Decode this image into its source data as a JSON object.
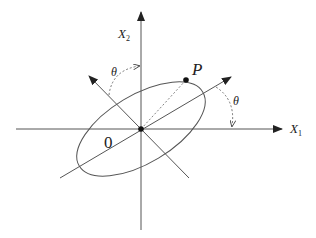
{
  "diagram": {
    "labels": {
      "x1_axis": "X",
      "x1_sub": "1",
      "x2_axis": "X",
      "x2_sub": "2",
      "point": "P",
      "origin": "0",
      "angle_upper": "θ",
      "angle_right": "θ"
    },
    "colors": {
      "line": "#555555",
      "axis": "#444444",
      "text": "#222222",
      "background": "#ffffff"
    },
    "geometry": {
      "origin": [
        141,
        129
      ],
      "rotation_deg": -31,
      "ellipse_semi_major": 72,
      "ellipse_semi_minor": 34,
      "point_P": [
        186,
        80
      ]
    }
  }
}
